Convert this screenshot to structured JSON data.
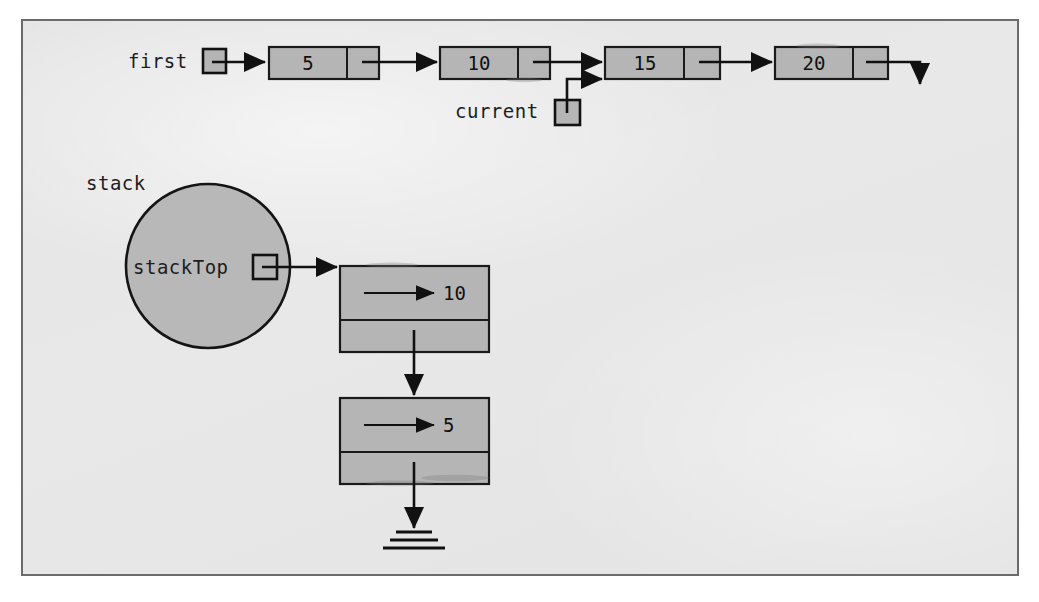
{
  "figure": {
    "title": "",
    "background_color": "#e8e8e8",
    "frame_color": "#6b6b6b",
    "node_fill": "#b5b5b5",
    "stroke_color": "#111111"
  },
  "linked_list": {
    "head_pointer_label": "first",
    "current_pointer_label": "current",
    "current_points_to_index": 2,
    "terminator": "null-arrow-down",
    "nodes": [
      {
        "value": "5"
      },
      {
        "value": "10"
      },
      {
        "value": "15"
      },
      {
        "value": "20"
      }
    ]
  },
  "stack": {
    "object_label": "stack",
    "top_pointer_label": "stackTop",
    "terminator": "ground-symbol",
    "nodes": [
      {
        "value": "10"
      },
      {
        "value": "5"
      }
    ]
  }
}
